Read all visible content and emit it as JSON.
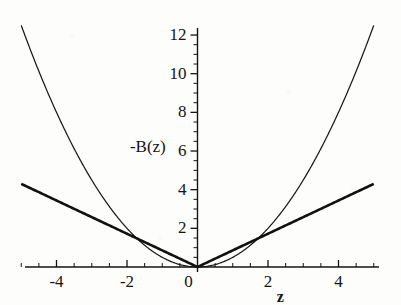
{
  "chart_data": {
    "type": "line",
    "title": "",
    "xlabel": "z",
    "ylabel": "-B(z)",
    "xlim": [
      -5,
      5
    ],
    "ylim": [
      0,
      12.8
    ],
    "grid": false,
    "legend": "none",
    "annotations": [
      {
        "text": "-B(z)",
        "role": "curve-family-label",
        "x": -1.35,
        "y": 6.2
      }
    ],
    "x_ticks_major": [
      -4,
      -2,
      0,
      2,
      4
    ],
    "x_tick_labels": [
      "-4",
      "-2",
      "0",
      "2",
      "4"
    ],
    "x_tick_minor_step": 0.5,
    "y_ticks_major": [
      2,
      4,
      6,
      8,
      10,
      12
    ],
    "y_tick_labels": [
      "2",
      "4",
      "6",
      "8",
      "10",
      "12"
    ],
    "y_tick_minor_step": 0.5,
    "series": [
      {
        "name": "parabola",
        "style": "thin",
        "formula": "0.5*z^2",
        "x": [
          -5,
          -4.5,
          -4,
          -3.5,
          -3,
          -2.5,
          -2,
          -1.5,
          -1,
          -0.5,
          0,
          0.5,
          1,
          1.5,
          2,
          2.5,
          3,
          3.5,
          4,
          4.5,
          5
        ],
        "values": [
          12.5,
          10.13,
          8.0,
          6.13,
          4.5,
          3.13,
          2.0,
          1.13,
          0.5,
          0.13,
          0,
          0.13,
          0.5,
          1.13,
          2.0,
          3.13,
          4.5,
          6.13,
          8.0,
          10.13,
          12.5
        ]
      },
      {
        "name": "absolute-value",
        "style": "thick",
        "formula": "0.86*|z|",
        "x": [
          -5,
          -4,
          -3,
          -2,
          -1,
          0,
          1,
          2,
          3,
          4,
          5
        ],
        "values": [
          4.3,
          3.44,
          2.58,
          1.72,
          0.86,
          0,
          0.86,
          1.72,
          2.58,
          3.44,
          4.3
        ]
      }
    ]
  },
  "axis": {
    "x_label": "z",
    "y_label": "-B(z)",
    "origin_label": "0"
  },
  "colors": {
    "axis": "#141414",
    "curve_thin": "#1a1a1a",
    "curve_thick": "#111111",
    "background": "#fdfdfc",
    "text": "#141414"
  }
}
